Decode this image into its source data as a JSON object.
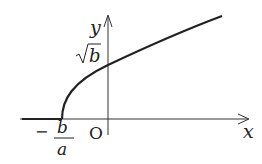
{
  "diagram": {
    "type": "function-graph",
    "function": "y = sqrt(a x + b), y = 0 for x < -b/a",
    "labels": {
      "x_axis": "x",
      "y_axis": "y",
      "origin": "O",
      "y_intercept": "√b",
      "y_intercept_radicand": "b",
      "x_start_sign": "−",
      "x_start_num": "b",
      "x_start_den": "a"
    }
  }
}
